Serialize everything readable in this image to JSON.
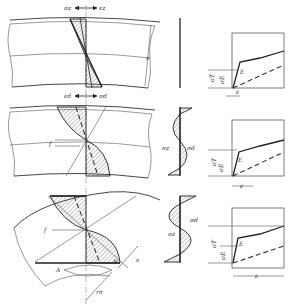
{
  "figure": {
    "rows": [
      {
        "name": "elastic-stage",
        "top_labels": {
          "left": "σz",
          "right": "εz"
        },
        "bottom_labels": {
          "left": "εd",
          "right": "σd"
        },
        "dimension_label": "s",
        "graph": {
          "stress_label": "σT",
          "stress_label_2": "σE",
          "strain_label": "ε",
          "curve_label": "E"
        }
      },
      {
        "name": "elastic-plastic-stage",
        "offset_label": "f",
        "residual_labels": {
          "left": "σz",
          "right": "σd"
        },
        "graph": {
          "stress_label": "σT",
          "stress_label_2": "σE",
          "strain_label": "ε",
          "curve_label": "E"
        }
      },
      {
        "name": "plastic-stage",
        "offset_label": "f",
        "angle_label": "A",
        "point_label": "B",
        "dimension_labels": {
          "radius": "rn",
          "thickness": "s"
        },
        "residual_labels": {
          "left": "σz",
          "right": "σd"
        },
        "graph": {
          "stress_label": "σT",
          "stress_label_2": "σE",
          "strain_label": "ε",
          "curve_label": "E"
        }
      }
    ]
  }
}
